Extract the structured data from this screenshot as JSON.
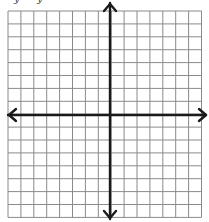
{
  "diagram": {
    "type": "coordinate-plane",
    "grid": {
      "left": 8,
      "top": 11,
      "cell": 12.9,
      "cols": 15,
      "rows": 16,
      "line_color": "#8a8a8a"
    },
    "axes": {
      "x_axis_y": 115,
      "y_axis_x": 110,
      "color": "#1a1a1a",
      "arrows": [
        "left",
        "right",
        "up",
        "down"
      ]
    },
    "top_text_fragments": [
      "y",
      "y"
    ]
  }
}
